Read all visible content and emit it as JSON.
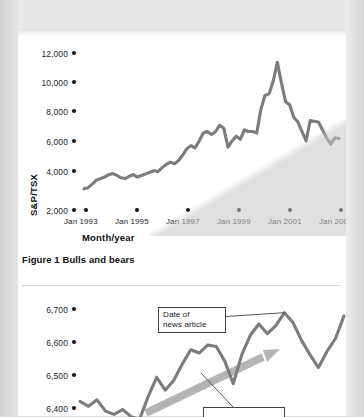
{
  "page": {
    "background_color": "#e9e9e9",
    "sheet_color": "#ffffff"
  },
  "figure1": {
    "caption": "Figure 1 Bulls and bears",
    "axis_title_y": "S&P/TSX",
    "axis_title_x": "Month/year"
  },
  "figure2": {
    "callout_label": "Date of\nnews article"
  },
  "chart_data": [
    {
      "id": "figure-1",
      "type": "line",
      "title": "Figure 1 Bulls and bears",
      "xlabel": "Month/year",
      "ylabel": "S&P/TSX",
      "ylim": [
        2000,
        12000
      ],
      "yticks": [
        2000,
        4000,
        6000,
        8000,
        10000,
        12000
      ],
      "ytick_labels": [
        "2,000",
        "4,000",
        "6,000",
        "8,000",
        "10,000",
        "12,000"
      ],
      "xticks": [
        "Jan 1993",
        "Jan 1995",
        "Jan 1997",
        "Jan 1999",
        "Jan 2001",
        "Jan 2003"
      ],
      "xlim": [
        "Jan 1993",
        "Jan 2003"
      ],
      "grid": false,
      "legend": "none",
      "line_color": "#7c7c7c",
      "series": [
        {
          "name": "S&P/TSX Composite Index",
          "x": [
            "1992-10",
            "1992-12",
            "1993-02",
            "1993-04",
            "1993-06",
            "1993-08",
            "1993-10",
            "1993-12",
            "1994-02",
            "1994-04",
            "1994-06",
            "1994-08",
            "1994-10",
            "1994-12",
            "1995-02",
            "1995-04",
            "1995-06",
            "1995-08",
            "1995-10",
            "1995-12",
            "1996-02",
            "1996-04",
            "1996-06",
            "1996-08",
            "1996-10",
            "1996-12",
            "1997-02",
            "1997-04",
            "1997-06",
            "1997-08",
            "1997-10",
            "1997-12",
            "1998-02",
            "1998-04",
            "1998-06",
            "1998-08",
            "1998-10",
            "1998-12",
            "1999-02",
            "1999-04",
            "1999-06",
            "1999-08",
            "1999-10",
            "1999-12",
            "2000-02",
            "2000-04",
            "2000-06",
            "2000-08",
            "2000-10",
            "2000-12",
            "2001-02",
            "2001-04",
            "2001-06",
            "2001-08",
            "2001-10",
            "2001-12",
            "2002-02",
            "2002-04",
            "2002-06",
            "2002-08",
            "2002-10",
            "2002-12",
            "2003-01"
          ],
          "values": [
            3350,
            3420,
            3650,
            3900,
            4000,
            4100,
            4250,
            4320,
            4200,
            4050,
            4000,
            4150,
            4250,
            4100,
            4200,
            4300,
            4400,
            4500,
            4450,
            4700,
            4900,
            5050,
            4950,
            5150,
            5500,
            5900,
            6100,
            5950,
            6400,
            6900,
            7000,
            6800,
            7000,
            7400,
            7200,
            6000,
            6400,
            6700,
            6500,
            7100,
            7000,
            7000,
            6900,
            8400,
            9300,
            9400,
            10200,
            11400,
            10100,
            8900,
            8700,
            7900,
            7600,
            7000,
            6400,
            7700,
            7650,
            7600,
            7100,
            6600,
            6200,
            6600,
            6550
          ]
        }
      ],
      "annotations": [
        {
          "type": "scan-shadow",
          "description": "diagonal light grey shadow over lower-right of plot"
        }
      ]
    },
    {
      "id": "figure-2",
      "type": "line",
      "title": "",
      "xlabel": "",
      "ylabel": "",
      "ylim": [
        6370,
        6720
      ],
      "yticks": [
        6400,
        6500,
        6600,
        6700
      ],
      "ytick_labels": [
        "6,400",
        "6,500",
        "6,600",
        "6,700"
      ],
      "xticks": [],
      "grid": false,
      "legend": "none",
      "line_color": "#7c7c7c",
      "series": [
        {
          "name": "index close",
          "x": [
            0,
            1,
            2,
            3,
            4,
            5,
            6,
            7,
            8,
            9,
            10,
            11,
            12,
            13,
            14,
            15,
            16,
            17,
            18,
            19,
            20,
            21,
            22,
            23,
            24,
            25,
            26,
            27,
            28,
            29,
            30,
            31
          ],
          "values": [
            6415,
            6400,
            6420,
            6385,
            6375,
            6390,
            6368,
            6360,
            6430,
            6490,
            6450,
            6480,
            6530,
            6575,
            6565,
            6590,
            6585,
            6540,
            6470,
            6560,
            6620,
            6655,
            6625,
            6650,
            6690,
            6660,
            6605,
            6560,
            6520,
            6570,
            6610,
            6680
          ]
        }
      ],
      "annotations": [
        {
          "type": "callout",
          "text": "Date of news article",
          "target": "peak near 6,690"
        },
        {
          "type": "trend-arrow",
          "direction": "up-right",
          "color": "#b4b4b4"
        },
        {
          "type": "callout-partial",
          "text": "",
          "note": "second callout box cropped at bottom edge"
        }
      ]
    }
  ]
}
